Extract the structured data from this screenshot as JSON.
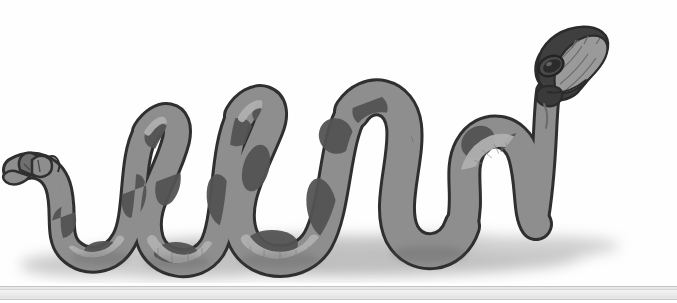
{
  "page": {
    "width": 677,
    "height": 303,
    "background_color": "#fefefe"
  },
  "illustration": {
    "subject": "snake",
    "style": "flat cartoon cel illustration, grayscale",
    "description": "A large coiled snake with a raised hooded head at the right, body wound into several vertical coils across the middle and left, and a forked tail tip at the far left, cast on a soft blurred drop shadow.",
    "alt_text": "Grayscale cartoon snake coiled in loops with its head raised at upper right",
    "colors": {
      "background": "#fefefe",
      "body_mid_gray": "#8e8e8e",
      "body_dark_gray": "#565656",
      "body_darkest": "#3f3f3f",
      "belly_light": "#a8a8a8",
      "belly_highlight": "#bdbdbd",
      "outline": "#2f2f2f",
      "shadow": "#9a9a9a",
      "eye": "#2b2b2b"
    },
    "parts": [
      {
        "name": "head",
        "label": "Head",
        "position": "upper right"
      },
      {
        "name": "hood",
        "label": "Hood",
        "position": "upper right"
      },
      {
        "name": "eye",
        "label": "Eye",
        "position": "head"
      },
      {
        "name": "neck",
        "label": "Neck",
        "position": "right"
      },
      {
        "name": "body-coils",
        "label": "Body coils",
        "position": "center"
      },
      {
        "name": "belly-scales",
        "label": "Ventral belly scales",
        "position": "underside"
      },
      {
        "name": "saddle-patches",
        "label": "Dark saddle patches",
        "position": "along body"
      },
      {
        "name": "tail-tip",
        "label": "Forked tail tip",
        "position": "far left"
      },
      {
        "name": "ground-shadow",
        "label": "Ground shadow",
        "position": "bottom"
      }
    ]
  },
  "bottom_bar": {
    "label": "Horizontal scrollbar",
    "track_color": "#ededed",
    "border_color": "#c4c4c4"
  }
}
